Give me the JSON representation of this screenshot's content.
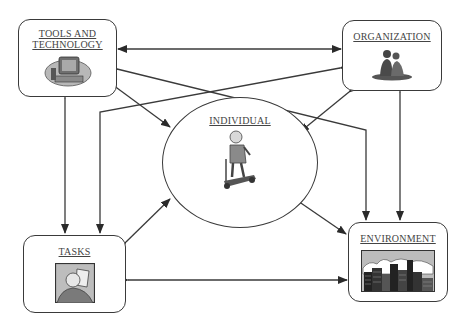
{
  "diagram": {
    "nodes": {
      "tools": {
        "label_line1": "TOOLS AND",
        "label_line2": "TECHNOLOGY",
        "icon": "computer-clipart-icon"
      },
      "organization": {
        "label": "ORGANIZATION",
        "icon": "people-group-clipart-icon"
      },
      "individual": {
        "label": "INDIVIDUAL",
        "icon": "person-scooter-clipart-icon"
      },
      "tasks": {
        "label": "TASKS",
        "icon": "person-reading-clipart-icon"
      },
      "environment": {
        "label": "ENVIRONMENT",
        "icon": "city-skyline-clipart-icon"
      }
    },
    "edges": [
      {
        "from": "tools",
        "to": "organization",
        "type": "bidirectional"
      },
      {
        "from": "tools",
        "to": "tasks",
        "type": "bidirectional"
      },
      {
        "from": "tools",
        "to": "individual",
        "type": "bidirectional"
      },
      {
        "from": "tools",
        "to": "environment",
        "type": "bidirectional"
      },
      {
        "from": "organization",
        "to": "tasks",
        "type": "bidirectional"
      },
      {
        "from": "organization",
        "to": "individual",
        "type": "bidirectional"
      },
      {
        "from": "organization",
        "to": "environment",
        "type": "bidirectional"
      },
      {
        "from": "tasks",
        "to": "individual",
        "type": "bidirectional"
      },
      {
        "from": "tasks",
        "to": "environment",
        "type": "bidirectional"
      },
      {
        "from": "individual",
        "to": "environment",
        "type": "bidirectional"
      }
    ],
    "colors": {
      "line": "#3a3a3a",
      "text": "#444444"
    }
  }
}
